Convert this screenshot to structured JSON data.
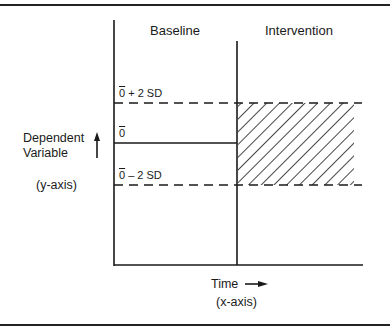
{
  "figure": {
    "phases": [
      {
        "label": "Baseline"
      },
      {
        "label": "Intervention"
      }
    ],
    "reference_lines": {
      "upper": {
        "symbol": "0",
        "suffix": " + 2 SD"
      },
      "mean": {
        "symbol": "0",
        "suffix": ""
      },
      "lower": {
        "symbol": "0",
        "suffix": " – 2 SD"
      }
    },
    "y_axis": {
      "line1": "Dependent",
      "line2": "Variable",
      "line3": "(y-axis)",
      "arrow": "up-arrow"
    },
    "x_axis": {
      "line1": "Time",
      "line2": "(x-axis)",
      "arrow": "right-arrow"
    },
    "shaded_region": "Intervention phase between ō − 2 SD and ō + 2 SD",
    "colors": {
      "ink": "#1a1a1a",
      "background": "#ffffff"
    }
  }
}
